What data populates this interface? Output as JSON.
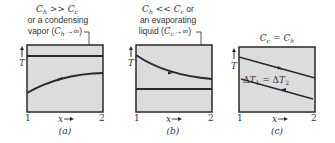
{
  "colors": {
    "panel_fill": "#dcdcdc",
    "line": "#2a2a2a",
    "text": "#333333",
    "background": "#ffffff"
  },
  "panels": [
    {
      "id": "a",
      "caption": "(a)",
      "title_line1_sym": "C",
      "title_line1_sub1": "h",
      "title_line1_op": " >> ",
      "title_line1_sym2": "C",
      "title_line1_sub2": "c",
      "title_line2": "or a condensing",
      "title_line3_text": "vapor (",
      "title_line3_sym": "C",
      "title_line3_sub": "h",
      "title_line3_arrow": "→∞)",
      "y_label": "T",
      "x_label": "x",
      "x_start": "1",
      "x_end": "2",
      "hot_stream": "constant",
      "cold_stream": "rising"
    },
    {
      "id": "b",
      "caption": "(b)",
      "title_line1_sym": "C",
      "title_line1_sub1": "h",
      "title_line1_op": " << ",
      "title_line1_sym2": "C",
      "title_line1_sub2": "c",
      "title_line1_tail": " or",
      "title_line2": "an evaporating",
      "title_line3_text": "liquid (",
      "title_line3_sym": "C",
      "title_line3_sub": "c",
      "title_line3_arrow": "→∞)",
      "y_label": "T",
      "x_label": "x",
      "x_start": "1",
      "x_end": "2",
      "hot_stream": "falling",
      "cold_stream": "constant"
    },
    {
      "id": "c",
      "caption": "(c)",
      "title_sym1": "C",
      "title_sub1": "c",
      "title_op": " = ",
      "title_sym2": "C",
      "title_sub2": "h",
      "annotation_delta": "Δ",
      "annotation_T": "T",
      "annotation_sub1": "1",
      "annotation_eq": " = Δ",
      "annotation_sub2": "2",
      "y_label": "T",
      "x_label": "x",
      "x_start": "1",
      "x_end": "2",
      "hot_stream": "falling (parallel)",
      "cold_stream": "falling (parallel, counterflow)"
    }
  ]
}
